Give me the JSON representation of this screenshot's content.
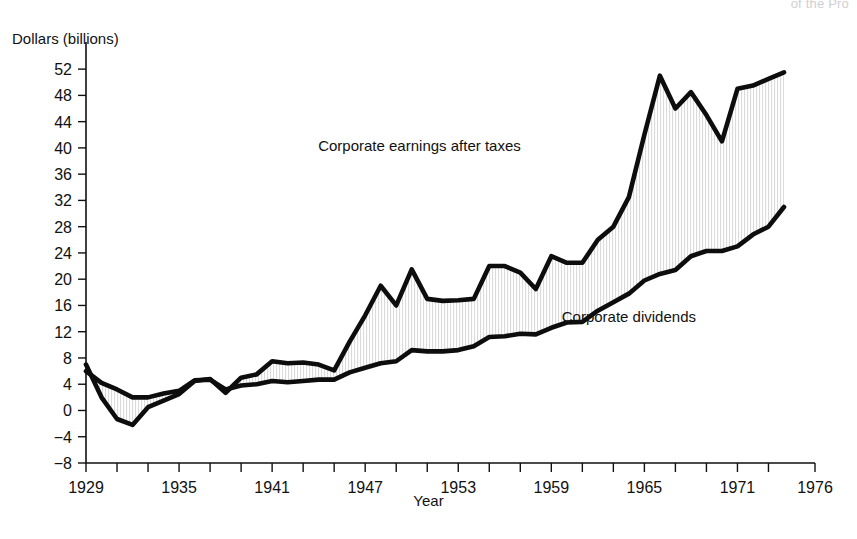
{
  "page": {
    "cut_off_header": "of the Pro",
    "background": "#ffffff",
    "ink_color": "#0d0d0d"
  },
  "chart_data": {
    "type": "line",
    "title": "",
    "xlabel": "Year",
    "ylabel": "Dollars (billions)",
    "xlim": [
      1929,
      1976
    ],
    "ylim": [
      -8,
      54
    ],
    "grid": false,
    "legend": "inline-annotations",
    "y_ticks": [
      52,
      48,
      44,
      40,
      36,
      32,
      28,
      24,
      20,
      16,
      12,
      8,
      4,
      0,
      -4,
      -8
    ],
    "y_tick_labels": [
      "52",
      "48",
      "44",
      "40",
      "36",
      "32",
      "28",
      "24",
      "20",
      "16",
      "12",
      "8",
      "4",
      "0",
      "−4",
      "−8"
    ],
    "x_ticks": [
      1929,
      1931,
      1933,
      1935,
      1937,
      1939,
      1941,
      1943,
      1945,
      1947,
      1949,
      1951,
      1953,
      1955,
      1957,
      1959,
      1961,
      1963,
      1965,
      1967,
      1969,
      1971,
      1973,
      1976
    ],
    "x_tick_labels": [
      "1929",
      "1935",
      "1941",
      "1947",
      "1953",
      "1959",
      "1965",
      "1971",
      "1976"
    ],
    "x_tick_label_years": [
      1929,
      1935,
      1941,
      1947,
      1953,
      1959,
      1965,
      1971,
      1976
    ],
    "x": [
      1929,
      1930,
      1931,
      1932,
      1933,
      1934,
      1935,
      1936,
      1937,
      1938,
      1939,
      1940,
      1941,
      1942,
      1943,
      1944,
      1945,
      1946,
      1947,
      1948,
      1949,
      1950,
      1951,
      1952,
      1953,
      1954,
      1955,
      1956,
      1957,
      1958,
      1959,
      1960,
      1961,
      1962,
      1963,
      1964,
      1965,
      1966,
      1967,
      1968,
      1969,
      1970,
      1971,
      1972,
      1973,
      1974
    ],
    "series": [
      {
        "name": "Corporate earnings after taxes",
        "label": "Corporate earnings after taxes",
        "label_x": 1950.5,
        "label_y": 39.5,
        "values": [
          7.0,
          2.0,
          -1.3,
          -2.2,
          0.5,
          1.5,
          2.5,
          4.5,
          4.8,
          2.7,
          5.0,
          5.5,
          7.5,
          7.2,
          7.3,
          7.0,
          6.1,
          10.5,
          14.5,
          19.0,
          16.0,
          21.5,
          17.0,
          16.7,
          16.8,
          17.0,
          22.0,
          22.0,
          21.0,
          18.5,
          23.5,
          22.5,
          22.5,
          26.0,
          28.0,
          32.5,
          42.0,
          51.0,
          46.0,
          48.5,
          45.0,
          41.0,
          49.0,
          49.5,
          50.5,
          51.5
        ]
      },
      {
        "name": "Corporate dividends",
        "label": "Corporate dividends",
        "label_x": 1964.0,
        "label_y": 13.5,
        "values": [
          6.0,
          4.2,
          3.2,
          2.0,
          2.0,
          2.6,
          3.0,
          4.6,
          4.7,
          3.2,
          3.8,
          4.0,
          4.5,
          4.3,
          4.5,
          4.7,
          4.7,
          5.8,
          6.5,
          7.2,
          7.5,
          9.2,
          9.0,
          9.0,
          9.2,
          9.8,
          11.2,
          11.3,
          11.7,
          11.6,
          12.6,
          13.4,
          13.5,
          15.2,
          16.5,
          17.8,
          19.8,
          20.8,
          21.4,
          23.5,
          24.3,
          24.3,
          25.0,
          26.8,
          28.0,
          31.0
        ]
      }
    ],
    "band_fill": "hatched-light-gray",
    "annotations": [
      {
        "text": "Corporate earnings after taxes",
        "x": 1950.5,
        "y": 39.5
      },
      {
        "text": "Corporate dividends",
        "x": 1964.0,
        "y": 13.5
      }
    ]
  }
}
